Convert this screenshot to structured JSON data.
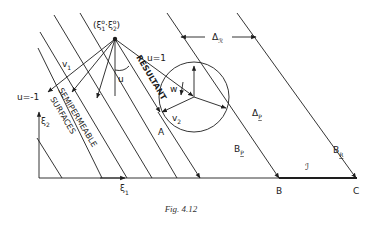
{
  "figure": {
    "caption": "Fig. 4.12",
    "point_label": {
      "open": "(ξ",
      "sub1": "1",
      "sup1": "o",
      "sep": "·ξ",
      "sub2": "2",
      "sup2": "o",
      "close": ")"
    },
    "axes": {
      "x_label": "ξ",
      "x_sub": "1",
      "y_label": "ξ",
      "y_sub": "2"
    },
    "labels": {
      "u_pos": "u=1",
      "u_neg": "u=-1",
      "u": "u",
      "v1": "v",
      "v1_sub": "1",
      "v2": "v",
      "v2_sub": "2",
      "w": "w",
      "resultant": "RESULTANT",
      "semipermeable": "SEMIPERMEABLE",
      "surfaces": "SURFACES",
      "A": "A",
      "B": "B",
      "C": "C",
      "delta_R": "Δ",
      "delta_R_sub": "ℛ",
      "delta_P": "Δ",
      "delta_P_sub": "P",
      "B_P": "B",
      "B_P_sub": "P",
      "B_R": "B",
      "B_R_sub": "R",
      "interval": "ℐ"
    }
  }
}
